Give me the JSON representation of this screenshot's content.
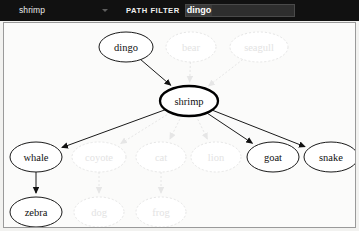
{
  "toolbar": {
    "node_select": {
      "selected": "shrimp",
      "caret_icon": "chevron-down-icon"
    },
    "path_filter": {
      "label": "PATH FILTER",
      "value": "dingo",
      "placeholder": ""
    }
  },
  "colors": {
    "toolbar_bg": "#111111",
    "canvas_bg": "#fbfbfa",
    "node_stroke": "#1a1a1a",
    "faded_stroke": "#e6e6e6",
    "faded_text": "#e3e3e3",
    "text": "#111111"
  },
  "graph": {
    "root": "shrimp",
    "nodes": [
      {
        "id": "dingo",
        "label": "dingo",
        "x": 125,
        "y": 46,
        "rx": 27,
        "ry": 15,
        "state": "active"
      },
      {
        "id": "bear",
        "label": "bear",
        "x": 190,
        "y": 46,
        "rx": 25,
        "ry": 15,
        "state": "faded"
      },
      {
        "id": "seagull",
        "label": "seagull",
        "x": 258,
        "y": 46,
        "rx": 29,
        "ry": 15,
        "state": "faded"
      },
      {
        "id": "shrimp",
        "label": "shrimp",
        "x": 188,
        "y": 100,
        "rx": 29,
        "ry": 15,
        "state": "root"
      },
      {
        "id": "whale",
        "label": "whale",
        "x": 35,
        "y": 156,
        "rx": 26,
        "ry": 15,
        "state": "active"
      },
      {
        "id": "coyote",
        "label": "coyote",
        "x": 98,
        "y": 156,
        "rx": 27,
        "ry": 15,
        "state": "faded"
      },
      {
        "id": "cat",
        "label": "cat",
        "x": 160,
        "y": 156,
        "rx": 25,
        "ry": 15,
        "state": "faded"
      },
      {
        "id": "lion",
        "label": "lion",
        "x": 215,
        "y": 156,
        "rx": 25,
        "ry": 15,
        "state": "faded"
      },
      {
        "id": "goat",
        "label": "goat",
        "x": 272,
        "y": 156,
        "rx": 26,
        "ry": 15,
        "state": "active"
      },
      {
        "id": "snake",
        "label": "snake",
        "x": 330,
        "y": 156,
        "rx": 27,
        "ry": 15,
        "state": "active"
      },
      {
        "id": "zebra",
        "label": "zebra",
        "x": 35,
        "y": 211,
        "rx": 26,
        "ry": 15,
        "state": "active"
      },
      {
        "id": "dog",
        "label": "dog",
        "x": 98,
        "y": 211,
        "rx": 25,
        "ry": 15,
        "state": "faded"
      },
      {
        "id": "frog",
        "label": "frog",
        "x": 160,
        "y": 211,
        "rx": 25,
        "ry": 15,
        "state": "faded"
      }
    ],
    "edges": [
      {
        "from": "dingo",
        "to": "shrimp",
        "state": "active"
      },
      {
        "from": "bear",
        "to": "shrimp",
        "state": "faded"
      },
      {
        "from": "seagull",
        "to": "shrimp",
        "state": "faded"
      },
      {
        "from": "shrimp",
        "to": "whale",
        "state": "active"
      },
      {
        "from": "shrimp",
        "to": "coyote",
        "state": "faded"
      },
      {
        "from": "shrimp",
        "to": "cat",
        "state": "faded"
      },
      {
        "from": "shrimp",
        "to": "lion",
        "state": "faded"
      },
      {
        "from": "shrimp",
        "to": "goat",
        "state": "active"
      },
      {
        "from": "shrimp",
        "to": "snake",
        "state": "active"
      },
      {
        "from": "whale",
        "to": "zebra",
        "state": "active"
      },
      {
        "from": "coyote",
        "to": "dog",
        "state": "faded"
      },
      {
        "from": "cat",
        "to": "frog",
        "state": "faded"
      }
    ]
  }
}
